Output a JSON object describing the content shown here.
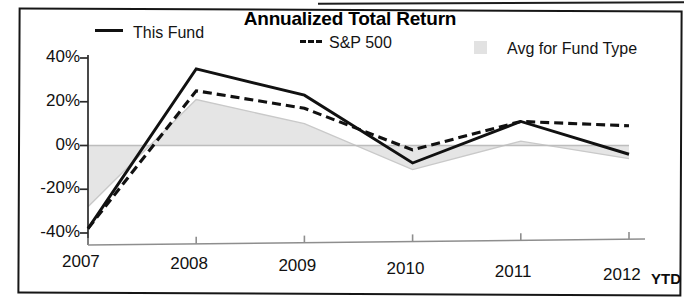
{
  "chart_data": {
    "type": "line",
    "title": "Annualized Total Return",
    "xlabel": "",
    "ylabel": "",
    "categories": [
      "2007",
      "2008",
      "2009",
      "2010",
      "2011",
      "2012"
    ],
    "x_tick_labels": [
      "2007",
      "2008",
      "2009",
      "2010",
      "2011",
      "2012"
    ],
    "x_axis_suffix": "YTD",
    "y_tick_labels": [
      "40%",
      "20%",
      "0%",
      "-20%",
      "-40%"
    ],
    "y_tick_values": [
      40,
      20,
      0,
      -20,
      -40
    ],
    "ylim": [
      -40,
      40
    ],
    "grid": false,
    "legend_position": "top",
    "zero_line": true,
    "series": [
      {
        "name": "This Fund",
        "style": "solid",
        "color": "#111111",
        "values": [
          -38,
          35,
          23,
          -8,
          11,
          -4
        ]
      },
      {
        "name": "S&P 500",
        "style": "dashed",
        "color": "#111111",
        "values": [
          -38,
          25,
          17,
          -2,
          11,
          9
        ]
      },
      {
        "name": "Avg for Fund Type",
        "style": "area",
        "color": "#e4e4e4",
        "values": [
          -28,
          21,
          10,
          -11,
          2,
          -6
        ]
      }
    ]
  },
  "legend": {
    "items": [
      {
        "label": "This Fund",
        "swatch": "solid-line-swatch"
      },
      {
        "label": "S&P 500",
        "swatch": "dashed-line-swatch"
      },
      {
        "label": "Avg for Fund Type",
        "swatch": "area-fill-swatch"
      }
    ]
  },
  "colors": {
    "line": "#111111",
    "area_fill": "#e4e4e4",
    "axis": "#2a2a2a",
    "frame": "#161616",
    "background": "#ffffff"
  }
}
